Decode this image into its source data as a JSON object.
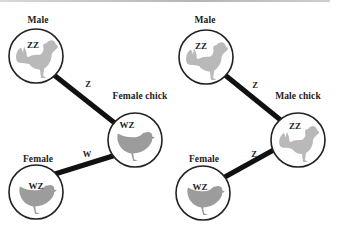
{
  "colors": {
    "line": "#111111",
    "circle_stroke": "#222222",
    "rooster_fill": "#b9b9b9",
    "hen_fill": "#9c9c9c",
    "top_rule": "#c4c4c4"
  },
  "panels": [
    {
      "parent_top": {
        "label": "Male",
        "genotype": "ZZ",
        "bird": "rooster-icon"
      },
      "offspring": {
        "label": "Female chick",
        "genotype": "WZ",
        "bird": "hen-icon"
      },
      "parent_bottom": {
        "label": "Female",
        "genotype": "WZ",
        "bird": "hen-icon"
      },
      "allele_from_top": "Z",
      "allele_from_bottom": "W"
    },
    {
      "parent_top": {
        "label": "Male",
        "genotype": "ZZ",
        "bird": "rooster-icon"
      },
      "offspring": {
        "label": "Male chick",
        "genotype": "ZZ",
        "bird": "rooster-icon"
      },
      "parent_bottom": {
        "label": "Female",
        "genotype": "WZ",
        "bird": "hen-icon"
      },
      "allele_from_top": "Z",
      "allele_from_bottom": "Z"
    }
  ]
}
